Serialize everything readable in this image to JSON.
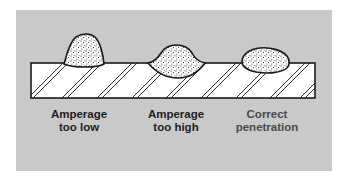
{
  "diagram": {
    "colors": {
      "background": "#ffffff",
      "panel": "#c9c9c9",
      "plate_fill": "#ffffff",
      "outline": "#1a1a1a",
      "label_text": "#1e1e1e",
      "label_text_correct": "#4a4a4a"
    },
    "welds": [
      {
        "id": "amperage-too-low",
        "label_line1": "Amperage",
        "label_line2": "too low"
      },
      {
        "id": "amperage-too-high",
        "label_line1": "Amperage",
        "label_line2": "too high"
      },
      {
        "id": "correct-penetration",
        "label_line1": "Correct",
        "label_line2": "penetration"
      }
    ]
  }
}
